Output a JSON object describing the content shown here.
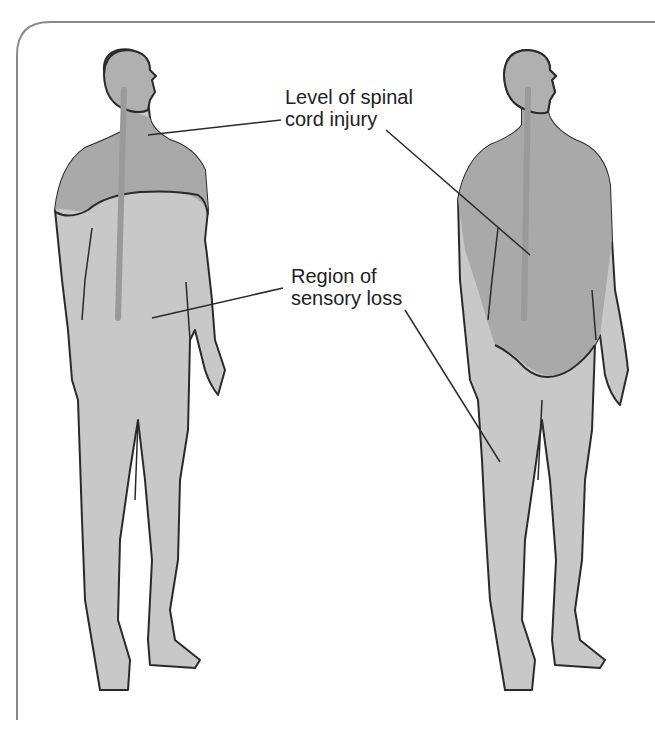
{
  "diagram": {
    "title": "",
    "labels": {
      "injury_level": {
        "line1": "Level of spinal",
        "line2": "cord injury"
      },
      "sensory_loss": {
        "line1": "Region of",
        "line2": "sensory loss"
      }
    },
    "figures": [
      {
        "name": "cervical-injury-figure",
        "description": "Injury at neck level; sensory loss below shoulders"
      },
      {
        "name": "thoracic-injury-figure",
        "description": "Injury at mid-back level; sensory loss below waist"
      }
    ],
    "colors": {
      "body_fill": "#c8c8c8",
      "affected_fill": "#a9a9a9",
      "outline": "#2a2a2a",
      "frame": "#8a8a8a",
      "spine": "#9a9a9a",
      "text": "#222222"
    }
  }
}
